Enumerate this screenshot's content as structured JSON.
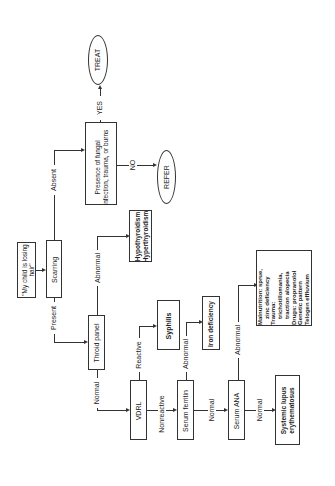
{
  "diagram": {
    "type": "flowchart",
    "orientation": "rotated-90-ccw",
    "nodes": {
      "start": "\"My child is losing hair\"",
      "scarring": "Scarring",
      "presence": "Presence of fungal infection, trauma, or burns",
      "treat": "TREAT",
      "refer": "REFER",
      "thyroid": "Throid panel",
      "thyroid_result": "Hypothyroidism Hyperthyroidism",
      "thyroid_result_1": "Hypothyroidism",
      "thyroid_result_2": "Hyperthyroidism",
      "vdrl": "VDRL",
      "syphilis": "Syphilis",
      "ferritin": "Serum ferritin",
      "iron": "Iron deficiency",
      "ana": "Serum ANA",
      "sle_1": "Systemic lupus",
      "sle_2": "erythematosus",
      "other_1": "Malnutrition: sprue,",
      "other_2": "zinc deficiency",
      "other_3": "Trauma:",
      "other_4": "trichotillomania,",
      "other_5": "traction alopecia",
      "other_6": "Drugs: propranolol",
      "other_7": "Genetic pattern",
      "other_8": "Telogen effluvium"
    },
    "edges": {
      "absent": "Absent",
      "present": "Present",
      "yes": "YES",
      "no": "NO",
      "thyroid_abnormal": "Abnormal",
      "thyroid_normal": "Normal",
      "vdrl_reactive": "Reactive",
      "vdrl_nonreactive": "Nonreactive",
      "ferritin_abnormal": "Abnormal",
      "ferritin_normal": "Normal",
      "ana_abnormal": "Abnormal",
      "ana_normal": "Normal"
    }
  }
}
